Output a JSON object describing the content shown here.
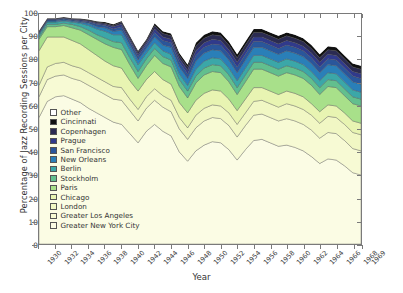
{
  "chart_data": {
    "type": "area",
    "title": "",
    "xlabel": "Year",
    "ylabel": "Percentage of Jazz Recording Sessions per City",
    "xlim": [
      1930,
      1969
    ],
    "ylim": [
      0,
      100
    ],
    "grid": false,
    "stacked": true,
    "legend_position": "inside-lower-left",
    "ytick_labels": [
      "0",
      "10",
      "20",
      "30",
      "40",
      "50",
      "60",
      "70",
      "80",
      "90",
      "100"
    ],
    "ytick_values": [
      0,
      10,
      20,
      30,
      40,
      50,
      60,
      70,
      80,
      90,
      100
    ],
    "xtick_labels": [
      "1930",
      "1932",
      "1934",
      "1936",
      "1938",
      "1940",
      "1942",
      "1944",
      "1946",
      "1948",
      "1950",
      "1952",
      "1954",
      "1956",
      "1958",
      "1960",
      "1962",
      "1964",
      "1966",
      "1968",
      "1969"
    ],
    "xtick_values": [
      1930,
      1932,
      1934,
      1936,
      1938,
      1940,
      1942,
      1944,
      1946,
      1948,
      1950,
      1952,
      1954,
      1956,
      1958,
      1960,
      1962,
      1964,
      1966,
      1968,
      1969
    ],
    "x": [
      1930,
      1931,
      1932,
      1933,
      1934,
      1935,
      1936,
      1937,
      1938,
      1939,
      1940,
      1941,
      1942,
      1943,
      1944,
      1945,
      1946,
      1947,
      1948,
      1949,
      1950,
      1951,
      1952,
      1953,
      1954,
      1955,
      1956,
      1957,
      1958,
      1959,
      1960,
      1961,
      1962,
      1963,
      1964,
      1965,
      1966,
      1967,
      1968,
      1969
    ],
    "series": [
      {
        "name": "Greater New York City",
        "color": "#fbfce4",
        "values": [
          55.0,
          62.0,
          64.0,
          64.5,
          63.0,
          61.5,
          59.0,
          57.0,
          55.0,
          53.0,
          52.0,
          48.0,
          44.0,
          49.0,
          52.0,
          49.0,
          47.0,
          40.0,
          36.0,
          40.5,
          43.0,
          44.5,
          44.0,
          41.0,
          36.5,
          41.0,
          45.0,
          45.5,
          44.0,
          42.5,
          43.0,
          42.0,
          40.5,
          38.0,
          35.0,
          37.0,
          36.5,
          34.0,
          31.0,
          30.0
        ]
      },
      {
        "name": "Greater Los Angeles",
        "color": "#f7fad4",
        "values": [
          9.0,
          9.5,
          9.0,
          9.0,
          9.0,
          9.5,
          10.0,
          10.0,
          10.0,
          10.0,
          10.5,
          10.0,
          9.5,
          10.0,
          10.5,
          10.5,
          10.5,
          10.0,
          9.5,
          10.0,
          10.5,
          10.5,
          10.5,
          10.5,
          10.0,
          10.5,
          11.0,
          11.0,
          11.0,
          11.0,
          11.5,
          11.5,
          11.5,
          11.5,
          11.0,
          11.5,
          11.5,
          11.0,
          10.5,
          10.5
        ]
      },
      {
        "name": "London",
        "color": "#f1f7c4",
        "values": [
          5.0,
          5.5,
          5.5,
          5.5,
          5.5,
          5.5,
          5.5,
          5.5,
          5.5,
          5.5,
          5.5,
          5.0,
          5.0,
          5.0,
          5.0,
          5.0,
          5.0,
          5.0,
          5.0,
          5.5,
          5.5,
          5.5,
          5.5,
          5.5,
          5.5,
          5.5,
          6.0,
          6.0,
          6.0,
          6.0,
          6.5,
          6.5,
          6.5,
          6.5,
          6.5,
          7.0,
          7.0,
          7.0,
          7.0,
          7.0
        ]
      },
      {
        "name": "Chicago",
        "color": "#e8f4b2",
        "values": [
          15.0,
          13.0,
          11.5,
          11.0,
          11.0,
          10.5,
          10.0,
          9.5,
          9.0,
          9.0,
          8.5,
          8.0,
          8.0,
          7.5,
          7.5,
          7.0,
          7.0,
          6.5,
          6.5,
          6.5,
          6.5,
          6.5,
          6.5,
          6.0,
          6.0,
          6.0,
          6.0,
          5.5,
          5.5,
          5.5,
          5.5,
          5.5,
          5.5,
          5.0,
          5.0,
          5.0,
          5.0,
          5.0,
          5.0,
          5.0
        ]
      },
      {
        "name": "Paris",
        "color": "#a8e08a",
        "values": [
          5.0,
          4.5,
          4.5,
          5.0,
          5.5,
          6.0,
          6.5,
          7.0,
          7.5,
          8.0,
          8.0,
          7.0,
          5.5,
          6.0,
          7.0,
          7.0,
          7.5,
          7.0,
          6.5,
          7.5,
          8.0,
          8.0,
          8.0,
          7.5,
          7.0,
          7.5,
          8.0,
          8.0,
          8.0,
          8.0,
          8.0,
          8.0,
          8.0,
          8.0,
          7.5,
          8.0,
          8.0,
          7.5,
          7.5,
          7.5
        ]
      },
      {
        "name": "Stockholm",
        "color": "#62bf8e",
        "values": [
          1.0,
          1.0,
          1.0,
          1.0,
          1.5,
          1.5,
          2.0,
          2.0,
          2.5,
          2.5,
          3.0,
          3.0,
          3.0,
          3.0,
          3.0,
          3.0,
          3.0,
          3.0,
          3.0,
          3.0,
          3.0,
          3.0,
          3.0,
          3.0,
          3.0,
          3.0,
          3.0,
          3.0,
          3.0,
          3.0,
          3.0,
          3.0,
          3.0,
          3.0,
          3.0,
          3.0,
          3.0,
          3.0,
          3.0,
          3.0
        ]
      },
      {
        "name": "Berlin",
        "color": "#3ba7a8",
        "values": [
          1.0,
          1.0,
          1.0,
          1.0,
          1.0,
          1.5,
          2.0,
          2.5,
          3.0,
          3.0,
          3.5,
          3.5,
          3.0,
          2.5,
          2.5,
          2.5,
          2.5,
          2.5,
          2.5,
          3.0,
          3.0,
          3.0,
          3.0,
          3.0,
          3.0,
          3.0,
          3.0,
          3.0,
          3.0,
          3.0,
          3.0,
          3.0,
          3.0,
          3.0,
          3.0,
          3.0,
          3.0,
          3.0,
          3.0,
          3.0
        ]
      },
      {
        "name": "New Orleans",
        "color": "#2a7fb8",
        "values": [
          0.5,
          0.5,
          0.5,
          0.5,
          0.5,
          0.5,
          1.0,
          1.0,
          1.5,
          1.5,
          2.0,
          2.0,
          2.0,
          2.0,
          2.5,
          2.5,
          3.0,
          3.0,
          3.0,
          3.5,
          3.5,
          3.5,
          3.5,
          3.5,
          3.5,
          3.5,
          3.5,
          3.5,
          3.5,
          3.5,
          3.5,
          3.5,
          3.5,
          3.5,
          3.5,
          3.5,
          3.5,
          3.5,
          3.5,
          3.5
        ]
      },
      {
        "name": "San Francisco",
        "color": "#2a569b",
        "values": [
          0.5,
          0.5,
          0.5,
          0.5,
          0.5,
          0.5,
          0.5,
          1.0,
          1.0,
          1.0,
          1.5,
          1.5,
          1.5,
          1.5,
          2.0,
          2.0,
          2.0,
          2.0,
          2.0,
          2.5,
          2.5,
          2.5,
          2.5,
          2.5,
          2.5,
          2.5,
          2.5,
          2.5,
          2.5,
          2.5,
          2.5,
          2.5,
          2.5,
          2.5,
          2.5,
          2.5,
          2.5,
          2.5,
          2.5,
          2.5
        ]
      },
      {
        "name": "Prague",
        "color": "#303a8c",
        "values": [
          0.3,
          0.3,
          0.3,
          0.3,
          0.3,
          0.5,
          0.5,
          0.5,
          0.5,
          1.0,
          1.0,
          1.0,
          1.0,
          1.0,
          1.5,
          1.5,
          1.5,
          1.5,
          1.5,
          2.0,
          2.0,
          2.0,
          2.0,
          2.0,
          2.0,
          2.0,
          2.0,
          2.0,
          2.0,
          2.0,
          2.0,
          2.0,
          2.0,
          2.0,
          2.0,
          2.0,
          2.0,
          2.0,
          2.0,
          2.0
        ]
      },
      {
        "name": "Copenhagen",
        "color": "#2b2b52",
        "values": [
          0.2,
          0.2,
          0.2,
          0.2,
          0.2,
          0.3,
          0.3,
          0.5,
          0.5,
          0.5,
          1.0,
          1.0,
          1.0,
          1.0,
          1.5,
          1.5,
          1.5,
          1.5,
          1.5,
          2.0,
          2.0,
          2.0,
          2.0,
          2.0,
          2.0,
          2.0,
          2.0,
          2.0,
          2.0,
          2.0,
          2.0,
          2.0,
          2.0,
          2.0,
          2.0,
          2.0,
          2.0,
          2.0,
          2.0,
          2.0
        ]
      },
      {
        "name": "Cincinnati",
        "color": "#111111",
        "values": [
          0.2,
          0.2,
          0.2,
          0.2,
          0.2,
          0.2,
          0.3,
          0.3,
          0.5,
          0.5,
          0.5,
          0.5,
          0.5,
          0.5,
          1.0,
          1.0,
          1.0,
          1.0,
          1.0,
          1.5,
          1.5,
          1.5,
          1.5,
          1.5,
          1.5,
          1.5,
          1.5,
          1.5,
          1.5,
          1.5,
          1.5,
          1.5,
          1.5,
          1.5,
          1.5,
          1.5,
          1.5,
          1.5,
          1.5,
          1.5
        ]
      },
      {
        "name": "Other",
        "color": "#ffffff",
        "values": [
          7.3,
          1.8,
          1.6,
          1.3,
          2.3,
          2.5,
          2.4,
          3.2,
          3.5,
          4.0,
          3.0,
          8.5,
          15.5,
          10.0,
          4.0,
          7.5,
          6.5,
          16.0,
          21.5,
          13.5,
          9.0,
          7.5,
          8.0,
          12.0,
          20.0,
          13.5,
          7.5,
          7.5,
          9.0,
          10.5,
          8.5,
          9.5,
          11.0,
          13.5,
          19.5,
          14.0,
          14.5,
          18.0,
          21.5,
          23.0
        ]
      }
    ],
    "legend_order_top_to_bottom": [
      "Other",
      "Cincinnati",
      "Copenhagen",
      "Prague",
      "San Francisco",
      "New Orleans",
      "Berlin",
      "Stockholm",
      "Paris",
      "Chicago",
      "London",
      "Greater Los Angeles",
      "Greater New York City"
    ]
  }
}
